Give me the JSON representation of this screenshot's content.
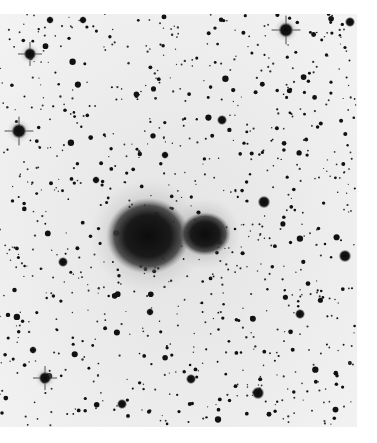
{
  "image": {
    "subject": "negative photographic plate of a star field with a double galaxy/nebula pair near center",
    "background_color": "#ececec",
    "ink_color": "#111111",
    "plate": {
      "x": 0,
      "y": 14,
      "width": 357,
      "height": 413
    },
    "galaxies": [
      {
        "cx": 148,
        "cy": 236,
        "rx": 42,
        "ry": 38,
        "halo": 58
      },
      {
        "cx": 205,
        "cy": 234,
        "rx": 26,
        "ry": 22,
        "halo": 36
      }
    ],
    "bright_stars": [
      {
        "x": 286,
        "y": 30,
        "r": 6,
        "spikes": true
      },
      {
        "x": 30,
        "y": 54,
        "r": 5,
        "spikes": true
      },
      {
        "x": 19,
        "y": 131,
        "r": 6,
        "spikes": true
      },
      {
        "x": 83,
        "y": 20,
        "r": 3
      },
      {
        "x": 50,
        "y": 20,
        "r": 3
      },
      {
        "x": 350,
        "y": 22,
        "r": 4
      },
      {
        "x": 345,
        "y": 256,
        "r": 5
      },
      {
        "x": 264,
        "y": 202,
        "r": 5
      },
      {
        "x": 222,
        "y": 120,
        "r": 4
      },
      {
        "x": 165,
        "y": 155,
        "r": 3
      },
      {
        "x": 63,
        "y": 262,
        "r": 4
      },
      {
        "x": 45,
        "y": 378,
        "r": 5,
        "spikes": true
      },
      {
        "x": 191,
        "y": 379,
        "r": 4
      },
      {
        "x": 258,
        "y": 393,
        "r": 5
      },
      {
        "x": 122,
        "y": 404,
        "r": 4
      },
      {
        "x": 33,
        "y": 350,
        "r": 3
      },
      {
        "x": 236,
        "y": 8,
        "r": 3
      },
      {
        "x": 150,
        "y": 312,
        "r": 3
      },
      {
        "x": 300,
        "y": 314,
        "r": 4
      },
      {
        "x": 96,
        "y": 180,
        "r": 3
      }
    ],
    "random_star_count": 900,
    "seed": 7
  }
}
